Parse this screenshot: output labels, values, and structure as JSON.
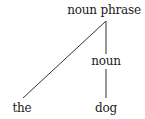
{
  "diagram": {
    "type": "syntax-tree",
    "colors": {
      "text": "#1a1a1a",
      "line": "#333333",
      "background": "#ffffff"
    },
    "nodes": [
      {
        "id": "np",
        "label": "noun phrase"
      },
      {
        "id": "noun",
        "label": "noun"
      },
      {
        "id": "the",
        "label": "the"
      },
      {
        "id": "dog",
        "label": "dog"
      }
    ],
    "edges": [
      {
        "from": "noun phrase",
        "to": "the"
      },
      {
        "from": "noun phrase",
        "to": "noun"
      },
      {
        "from": "noun",
        "to": "dog"
      }
    ]
  }
}
